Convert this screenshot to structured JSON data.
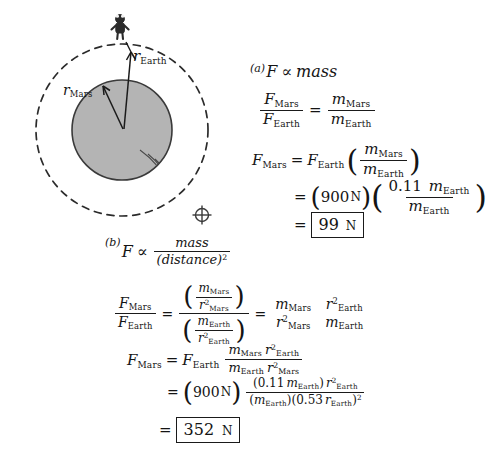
{
  "page": {
    "background_color": "#ffffff",
    "ink_color": "#1a1a1a",
    "planet_fill": "#b3b3b3"
  },
  "figure": {
    "name": "mars-earth-radius-diagram",
    "outer_circle_label": "dashed-earth-radius-circle",
    "inner_circle_label": "shaded-mars-planet",
    "person_label": "stick-figure-person",
    "earth_symbol": "⊕",
    "labels": {
      "r_earth": "r",
      "r_earth_sub": "Earth",
      "r_mars": "r",
      "r_mars_sub": "Mars"
    }
  },
  "part_a": {
    "label": "(a)",
    "statement": {
      "F": "F",
      "prop": "∝",
      "mass": "mass"
    },
    "ratio_eq": {
      "lhs_num": "F",
      "lhs_num_sub": "Mars",
      "lhs_den": "F",
      "lhs_den_sub": "Earth",
      "equals": "=",
      "rhs_num": "m",
      "rhs_num_sub": "Mars",
      "rhs_den": "m",
      "rhs_den_sub": "Earth"
    },
    "solve_eq": {
      "lhs": "F",
      "lhs_sub": "Mars",
      "equals": "=",
      "F_earth": "F",
      "F_earth_sub": "Earth",
      "paren_open": "(",
      "num": "m",
      "num_sub": "Mars",
      "den": "m",
      "den_sub": "Earth",
      "paren_close": ")"
    },
    "numeric_eq": {
      "equals": "=",
      "paren_open": "(",
      "force_value": "900",
      "force_unit": "N",
      "paren_close": ")",
      "frac_open": "(",
      "num_coeff": "0.11",
      "num_sym": "m",
      "num_sub": "Earth",
      "den_sym": "m",
      "den_sub": "Earth",
      "frac_close": ")"
    },
    "answer": {
      "equals": "=",
      "value": "99",
      "unit": "N"
    }
  },
  "part_b": {
    "label": "(b)",
    "statement": {
      "F": "F",
      "prop": "∝",
      "num": "mass",
      "den": "(distance)",
      "den_exp": "2"
    },
    "ratio_eq": {
      "lhs_num": "F",
      "lhs_num_sub": "Mars",
      "lhs_den": "F",
      "lhs_den_sub": "Earth",
      "equals1": "=",
      "top_paren_open": "(",
      "top_num": "m",
      "top_num_sub": "Mars",
      "top_den": "r",
      "top_den_exp": "2",
      "top_den_sub": "Mars",
      "top_paren_close": ")",
      "bot_paren_open": "(",
      "bot_num": "m",
      "bot_num_sub": "Earth",
      "bot_den": "r",
      "bot_den_exp": "2",
      "bot_den_sub": "Earth",
      "bot_paren_close": ")",
      "equals2": "=",
      "r1_num": "m",
      "r1_num_sub": "Mars",
      "r1_den": "r",
      "r1_den_exp": "2",
      "r1_den_sub": "Mars",
      "r2_num": "r",
      "r2_num_exp": "2",
      "r2_num_sub": "Earth",
      "r2_den": "m",
      "r2_den_sub": "Earth"
    },
    "solve_eq": {
      "lhs": "F",
      "lhs_sub": "Mars",
      "equals": "=",
      "F_earth": "F",
      "F_earth_sub": "Earth",
      "num_m": "m",
      "num_m_sub": "Mars",
      "num_r": "r",
      "num_r_exp": "2",
      "num_r_sub": "Earth",
      "den_m": "m",
      "den_m_sub": "Earth",
      "den_r": "r",
      "den_r_exp": "2",
      "den_r_sub": "Mars"
    },
    "numeric_eq": {
      "equals": "=",
      "paren_open": "(",
      "force_value": "900",
      "force_unit": "N",
      "paren_close": ")",
      "num_paren_open": "(",
      "num_coeff": "0.11",
      "num_m": "m",
      "num_m_sub": "Earth",
      "num_paren_close": ")",
      "num_r": "r",
      "num_r_exp": "2",
      "num_r_sub": "Earth",
      "den_paren1_open": "(",
      "den_m": "m",
      "den_m_sub": "Earth",
      "den_paren1_close": ")",
      "den_paren2_open": "(",
      "den_coeff": "0.53",
      "den_r": "r",
      "den_r_sub": "Earth",
      "den_paren2_close": ")",
      "den_exp": "2"
    },
    "answer": {
      "equals": "=",
      "value": "352",
      "unit": "N"
    }
  }
}
